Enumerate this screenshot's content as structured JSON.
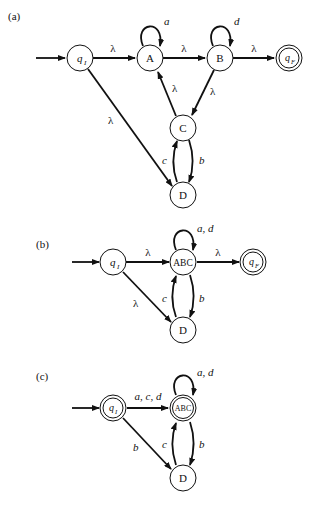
{
  "figure": {
    "caption_legible": false,
    "panels": [
      {
        "label": "(a)",
        "states": [
          {
            "id": "qI",
            "text": "q",
            "sub": "I",
            "initial": true,
            "final": false
          },
          {
            "id": "A",
            "text": "A",
            "initial": false,
            "final": false
          },
          {
            "id": "B",
            "text": "B",
            "initial": false,
            "final": false
          },
          {
            "id": "qF",
            "text": "q",
            "sub": "F",
            "initial": false,
            "final": true
          },
          {
            "id": "C",
            "text": "C",
            "initial": false,
            "final": false
          },
          {
            "id": "D",
            "text": "D",
            "initial": false,
            "final": false
          }
        ],
        "transitions": [
          {
            "from": "qI",
            "to": "A",
            "label": "λ"
          },
          {
            "from": "A",
            "to": "A",
            "label": "a"
          },
          {
            "from": "A",
            "to": "B",
            "label": "λ"
          },
          {
            "from": "B",
            "to": "B",
            "label": "d"
          },
          {
            "from": "B",
            "to": "qF",
            "label": "λ"
          },
          {
            "from": "B",
            "to": "C",
            "label": "λ"
          },
          {
            "from": "C",
            "to": "A",
            "label": "λ"
          },
          {
            "from": "qI",
            "to": "D",
            "label": "λ"
          },
          {
            "from": "C",
            "to": "D",
            "label": "b"
          },
          {
            "from": "D",
            "to": "C",
            "label": "c"
          }
        ]
      },
      {
        "label": "(b)",
        "states": [
          {
            "id": "qI",
            "text": "q",
            "sub": "I",
            "initial": true,
            "final": false
          },
          {
            "id": "ABC",
            "text": "ABC",
            "initial": false,
            "final": false
          },
          {
            "id": "qF",
            "text": "q",
            "sub": "F",
            "initial": false,
            "final": true
          },
          {
            "id": "D",
            "text": "D",
            "initial": false,
            "final": false
          }
        ],
        "transitions": [
          {
            "from": "qI",
            "to": "ABC",
            "label": "λ"
          },
          {
            "from": "ABC",
            "to": "ABC",
            "label": "a, d"
          },
          {
            "from": "ABC",
            "to": "qF",
            "label": "λ"
          },
          {
            "from": "qI",
            "to": "D",
            "label": "λ"
          },
          {
            "from": "ABC",
            "to": "D",
            "label": "b"
          },
          {
            "from": "D",
            "to": "ABC",
            "label": "c"
          }
        ]
      },
      {
        "label": "(c)",
        "states": [
          {
            "id": "qI",
            "text": "q",
            "sub": "I",
            "initial": true,
            "final": true
          },
          {
            "id": "ABC",
            "text": "ABC",
            "initial": false,
            "final": true
          },
          {
            "id": "D",
            "text": "D",
            "initial": false,
            "final": false
          }
        ],
        "transitions": [
          {
            "from": "qI",
            "to": "ABC",
            "label": "a, c, d"
          },
          {
            "from": "ABC",
            "to": "ABC",
            "label": "a, d"
          },
          {
            "from": "qI",
            "to": "D",
            "label": "b"
          },
          {
            "from": "ABC",
            "to": "D",
            "label": "b"
          },
          {
            "from": "D",
            "to": "ABC",
            "label": "c"
          }
        ]
      }
    ]
  }
}
